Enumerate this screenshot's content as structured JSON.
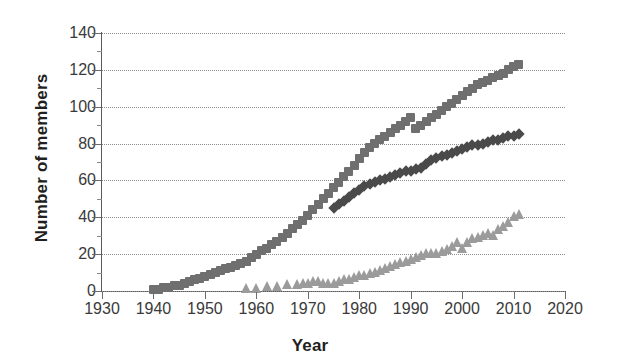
{
  "chart_data": {
    "type": "scatter",
    "title": "",
    "xlabel": "Year",
    "ylabel": "Number of members",
    "xlim": [
      1930,
      2020
    ],
    "ylim": [
      0,
      140
    ],
    "xticks": [
      1930,
      1940,
      1950,
      1960,
      1970,
      1980,
      1990,
      2000,
      2010,
      2020
    ],
    "yticks": [
      0,
      20,
      40,
      60,
      80,
      100,
      120,
      140
    ],
    "grid": "horizontal-dotted",
    "legend": "none",
    "series": [
      {
        "name": "squares-series",
        "marker": "square",
        "color": "#6f6f6f",
        "points": [
          [
            1940,
            1
          ],
          [
            1941,
            1
          ],
          [
            1942,
            2
          ],
          [
            1943,
            2
          ],
          [
            1944,
            3
          ],
          [
            1945,
            3
          ],
          [
            1946,
            4
          ],
          [
            1947,
            5
          ],
          [
            1948,
            6
          ],
          [
            1949,
            7
          ],
          [
            1950,
            8
          ],
          [
            1951,
            9
          ],
          [
            1952,
            10
          ],
          [
            1953,
            11
          ],
          [
            1954,
            12
          ],
          [
            1955,
            13
          ],
          [
            1956,
            14
          ],
          [
            1957,
            15
          ],
          [
            1958,
            16
          ],
          [
            1959,
            18
          ],
          [
            1960,
            20
          ],
          [
            1961,
            22
          ],
          [
            1962,
            23
          ],
          [
            1963,
            25
          ],
          [
            1964,
            27
          ],
          [
            1965,
            29
          ],
          [
            1966,
            31
          ],
          [
            1967,
            34
          ],
          [
            1968,
            36
          ],
          [
            1969,
            38
          ],
          [
            1970,
            41
          ],
          [
            1971,
            44
          ],
          [
            1972,
            47
          ],
          [
            1973,
            50
          ],
          [
            1974,
            53
          ],
          [
            1975,
            56
          ],
          [
            1976,
            59
          ],
          [
            1977,
            62
          ],
          [
            1978,
            65
          ],
          [
            1979,
            68
          ],
          [
            1980,
            72
          ],
          [
            1981,
            75
          ],
          [
            1982,
            78
          ],
          [
            1983,
            80
          ],
          [
            1984,
            82
          ],
          [
            1985,
            84
          ],
          [
            1986,
            86
          ],
          [
            1987,
            88
          ],
          [
            1988,
            90
          ],
          [
            1989,
            92
          ],
          [
            1990,
            94
          ],
          [
            1991,
            88
          ],
          [
            1992,
            90
          ],
          [
            1993,
            92
          ],
          [
            1994,
            94
          ],
          [
            1995,
            96
          ],
          [
            1996,
            98
          ],
          [
            1997,
            100
          ],
          [
            1998,
            102
          ],
          [
            1999,
            104
          ],
          [
            2000,
            106
          ],
          [
            2001,
            108
          ],
          [
            2002,
            110
          ],
          [
            2003,
            112
          ],
          [
            2004,
            113
          ],
          [
            2005,
            114
          ],
          [
            2006,
            116
          ],
          [
            2007,
            117
          ],
          [
            2008,
            118
          ],
          [
            2009,
            120
          ],
          [
            2010,
            122
          ],
          [
            2011,
            123
          ]
        ]
      },
      {
        "name": "diamonds-series",
        "marker": "diamond",
        "color": "#4a4a4a",
        "points": [
          [
            1975,
            45
          ],
          [
            1976,
            47
          ],
          [
            1977,
            49
          ],
          [
            1978,
            51
          ],
          [
            1979,
            53
          ],
          [
            1980,
            55
          ],
          [
            1981,
            57
          ],
          [
            1982,
            58
          ],
          [
            1983,
            59
          ],
          [
            1984,
            60
          ],
          [
            1985,
            61
          ],
          [
            1986,
            62
          ],
          [
            1987,
            63
          ],
          [
            1988,
            64
          ],
          [
            1989,
            65
          ],
          [
            1990,
            65
          ],
          [
            1991,
            66
          ],
          [
            1992,
            67
          ],
          [
            1993,
            69
          ],
          [
            1994,
            71
          ],
          [
            1995,
            72
          ],
          [
            1996,
            73
          ],
          [
            1997,
            74
          ],
          [
            1998,
            75
          ],
          [
            1999,
            76
          ],
          [
            2000,
            77
          ],
          [
            2001,
            78
          ],
          [
            2002,
            79
          ],
          [
            2003,
            79
          ],
          [
            2004,
            80
          ],
          [
            2005,
            81
          ],
          [
            2006,
            82
          ],
          [
            2007,
            82
          ],
          [
            2008,
            83
          ],
          [
            2009,
            84
          ],
          [
            2010,
            84
          ],
          [
            2011,
            85
          ]
        ]
      },
      {
        "name": "triangles-series",
        "marker": "triangle",
        "color": "#9b9b9b",
        "points": [
          [
            1958,
            1
          ],
          [
            1960,
            1
          ],
          [
            1962,
            2
          ],
          [
            1964,
            2
          ],
          [
            1966,
            3
          ],
          [
            1968,
            3
          ],
          [
            1969,
            4
          ],
          [
            1970,
            4
          ],
          [
            1971,
            5
          ],
          [
            1972,
            5
          ],
          [
            1973,
            4
          ],
          [
            1974,
            4
          ],
          [
            1975,
            4
          ],
          [
            1976,
            5
          ],
          [
            1977,
            6
          ],
          [
            1978,
            6
          ],
          [
            1979,
            7
          ],
          [
            1980,
            8
          ],
          [
            1981,
            8
          ],
          [
            1982,
            9
          ],
          [
            1983,
            10
          ],
          [
            1984,
            11
          ],
          [
            1985,
            12
          ],
          [
            1986,
            13
          ],
          [
            1987,
            14
          ],
          [
            1988,
            15
          ],
          [
            1989,
            16
          ],
          [
            1990,
            17
          ],
          [
            1991,
            18
          ],
          [
            1992,
            19
          ],
          [
            1993,
            20
          ],
          [
            1994,
            20
          ],
          [
            1995,
            20
          ],
          [
            1996,
            21
          ],
          [
            1997,
            22
          ],
          [
            1998,
            24
          ],
          [
            1999,
            26
          ],
          [
            2000,
            23
          ],
          [
            2001,
            26
          ],
          [
            2002,
            28
          ],
          [
            2003,
            29
          ],
          [
            2004,
            30
          ],
          [
            2005,
            31
          ],
          [
            2006,
            30
          ],
          [
            2007,
            33
          ],
          [
            2008,
            35
          ],
          [
            2009,
            37
          ],
          [
            2010,
            40
          ],
          [
            2011,
            41
          ]
        ]
      }
    ]
  },
  "axes": {
    "ylabel_text": "Number of members",
    "xlabel_text": "Year",
    "ytick_labels": [
      "0",
      "20",
      "40",
      "60",
      "80",
      "100",
      "120",
      "140"
    ],
    "xtick_labels": [
      "1930",
      "1940",
      "1950",
      "1960",
      "1970",
      "1980",
      "1990",
      "2000",
      "2010",
      "2020"
    ]
  },
  "colors": {
    "axis": "#5a5a5a",
    "grid": "#8c8c8c",
    "tick_text": "#3a3a3a",
    "label_text": "#231f20",
    "series_squares": "#6f6f6f",
    "series_diamonds": "#4a4a4a",
    "series_triangles": "#9b9b9b",
    "background": "#ffffff"
  }
}
